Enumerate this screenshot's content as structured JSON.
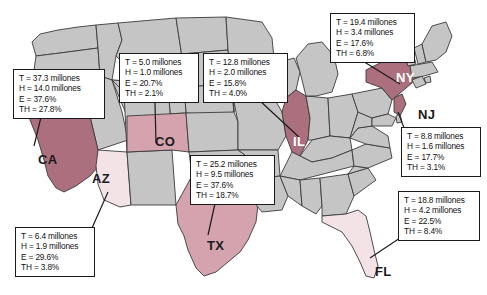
{
  "figure": {
    "type": "choropleth-map",
    "region": "United States",
    "background_color": "#ffffff",
    "base_state_color": "#c5c5c5",
    "state_border_color": "#3a3a3a",
    "highlight_colors": {
      "high": "#ab6f7d",
      "medium": "#d4a3ad",
      "low": "#f3e3e6"
    },
    "callout_box": {
      "fill": "#ffffff",
      "border": "#1a1a1a",
      "leader_line": "#1a1a1a"
    },
    "metric_keys": [
      "T",
      "H",
      "E",
      "TH"
    ]
  },
  "states": [
    {
      "code": "CA",
      "label": "CA",
      "shade": "high",
      "label_color": "#1a1a1a",
      "callout": {
        "lines": [
          "T = 37.3 millones",
          "H = 14.0 millones",
          "E = 37.6%",
          "TH = 27.8%"
        ],
        "T": "37.3 millones",
        "H": "14.0 millones",
        "E": "37.6%",
        "TH": "27.8%"
      }
    },
    {
      "code": "UT-area",
      "label": "",
      "shade": "none",
      "label_color": "#1a1a1a",
      "callout": {
        "lines": [
          "T = 5.0 millones",
          "H = 1.0 millones",
          "E = 20.7%",
          "TH = 2.1%"
        ],
        "T": "5.0 millones",
        "H": "1.0 millones",
        "E": "20.7%",
        "TH": "2.1%"
      }
    },
    {
      "code": "IL",
      "label": "IL",
      "shade": "high",
      "label_color": "#1a1a1a",
      "callout": {
        "lines": [
          "T = 12.8 millones",
          "H = 2.0 millones",
          "E = 15.8%",
          "TH = 4.0%"
        ],
        "T": "12.8 millones",
        "H": "2.0 millones",
        "E": "15.8%",
        "TH": "4.0%"
      }
    },
    {
      "code": "NY",
      "label": "NY",
      "shade": "high",
      "label_color": "#ffffff",
      "callout": {
        "lines": [
          "T = 19.4 millones",
          "H = 3.4 millones",
          "E = 17.6%",
          "TH = 6.8%"
        ],
        "T": "19.4 millones",
        "H": "3.4 millones",
        "E": "17.6%",
        "TH": "6.8%"
      }
    },
    {
      "code": "NJ",
      "label": "NJ",
      "shade": "high",
      "label_color": "#1a1a1a",
      "callout": {
        "lines": [
          "T = 8.8 millones",
          "H = 1.6 millones",
          "E = 17.7%",
          "TH = 3.1%"
        ],
        "T": "8.8 millones",
        "H": "1.6 millones",
        "E": "17.7%",
        "TH": "3.1%"
      }
    },
    {
      "code": "CO",
      "label": "CO",
      "shade": "medium",
      "label_color": "#1a1a1a",
      "callout": null
    },
    {
      "code": "TX",
      "label": "TX",
      "shade": "medium",
      "label_color": "#1a1a1a",
      "callout": {
        "lines": [
          "T = 25.2 millones",
          "H = 9.5 millones",
          "E = 37.6%",
          "TH = 18.7%"
        ],
        "T": "25.2 millones",
        "H": "9.5 millones",
        "E": "37.6%",
        "TH": "18.7%"
      }
    },
    {
      "code": "AZ",
      "label": "AZ",
      "shade": "low",
      "label_color": "#1a1a1a",
      "callout": {
        "lines": [
          "T = 6.4 millones",
          "H = 1.9 millones",
          "E = 29.6%",
          "TH = 3.8%"
        ],
        "T": "6.4 millones",
        "H": "1.9 millones",
        "E": "29.6%",
        "TH": "3.8%"
      }
    },
    {
      "code": "FL",
      "label": "FL",
      "shade": "low",
      "label_color": "#1a1a1a",
      "callout": {
        "lines": [
          "T = 18.8 millones",
          "H = 4.2 millones",
          "E = 22.5%",
          "TH = 8.4%"
        ],
        "T": "18.8 millones",
        "H": "4.2 millones",
        "E": "22.5%",
        "TH": "8.4%"
      }
    }
  ],
  "callouts": {
    "ca": {
      "l1": "T = 37.3 millones",
      "l2": "H = 14.0 millones",
      "l3": "E = 37.6%",
      "l4": "TH = 27.8%"
    },
    "ut": {
      "l1": "T = 5.0 millones",
      "l2": "H = 1.0 millones",
      "l3": "E = 20.7%",
      "l4": "TH = 2.1%"
    },
    "il": {
      "l1": "T = 12.8 millones",
      "l2": "H = 2.0 millones",
      "l3": "E = 15.8%",
      "l4": "TH = 4.0%"
    },
    "ny": {
      "l1": "T = 19.4 millones",
      "l2": "H = 3.4 millones",
      "l3": "E = 17.6%",
      "l4": "TH = 6.8%"
    },
    "nj": {
      "l1": "T = 8.8 millones",
      "l2": "H = 1.6 millones",
      "l3": "E = 17.7%",
      "l4": "TH = 3.1%"
    },
    "tx": {
      "l1": "T = 25.2 millones",
      "l2": "H = 9.5 millones",
      "l3": "E = 37.6%",
      "l4": "TH = 18.7%"
    },
    "az": {
      "l1": "T = 6.4 millones",
      "l2": "H = 1.9 millones",
      "l3": "E = 29.6%",
      "l4": "TH = 3.8%"
    },
    "fl": {
      "l1": "T = 18.8 millones",
      "l2": "H = 4.2 millones",
      "l3": "E = 22.5%",
      "l4": "TH = 8.4%"
    }
  },
  "labels": {
    "ca": "CA",
    "az": "AZ",
    "co": "CO",
    "tx": "TX",
    "il": "IL",
    "ny": "NY",
    "nj": "NJ",
    "fl": "FL"
  }
}
